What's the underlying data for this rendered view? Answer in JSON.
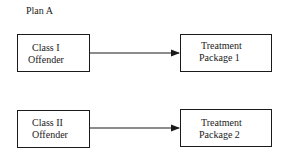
{
  "diagram": {
    "title": "Plan A",
    "rows": [
      {
        "source": {
          "line1": "Class I",
          "line2": "Offender"
        },
        "target": {
          "line1": "Treatment",
          "line2": "Package 1"
        }
      },
      {
        "source": {
          "line1": "Class II",
          "line2": "Offender"
        },
        "target": {
          "line1": "Treatment",
          "line2": "Package 2"
        }
      }
    ],
    "colors": {
      "line": "#1a1a1a",
      "background": "#ffffff"
    }
  }
}
